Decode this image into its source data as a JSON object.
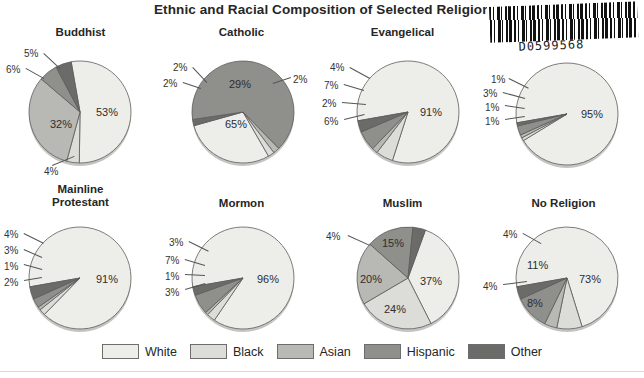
{
  "title": "Ethnic and Racial Composition of Selected Religions,",
  "barcode": {
    "number": "D0599568",
    "alt": "barcode-sticker"
  },
  "legend": {
    "items": [
      {
        "label": "White",
        "color": "#ededea"
      },
      {
        "label": "Black",
        "color": "#dcdcd8"
      },
      {
        "label": "Asian",
        "color": "#b8b8b4"
      },
      {
        "label": "Hispanic",
        "color": "#8f8f8c"
      },
      {
        "label": "Other",
        "color": "#6b6b69"
      }
    ]
  },
  "chart_data": {
    "type": "pie",
    "title": "Ethnic and Racial Composition of Selected Religions,",
    "categories": [
      "White",
      "Black",
      "Asian",
      "Hispanic",
      "Other"
    ],
    "colors": [
      "#ededea",
      "#dcdcd8",
      "#b8b8b4",
      "#8f8f8c",
      "#6b6b69"
    ],
    "unit": "%",
    "legend_position": "bottom",
    "charts": [
      {
        "name": "Buddhist",
        "title": "Buddhist",
        "values": [
          53,
          4,
          32,
          6,
          5
        ],
        "labels": [
          "53%",
          "4%",
          "32%",
          "6%",
          "5%"
        ]
      },
      {
        "name": "Catholic",
        "title": "Catholic",
        "values": [
          29,
          2,
          2,
          65,
          2
        ],
        "labels": [
          "29%",
          "2%",
          "2%",
          "65%",
          "2%"
        ]
      },
      {
        "name": "Evangelical",
        "title": "Evangelical",
        "values": [
          91,
          6,
          2,
          7,
          4
        ],
        "labels": [
          "91%",
          "6%",
          "2%",
          "7%",
          "4%"
        ]
      },
      {
        "name": "Jewish",
        "title": "",
        "values": [
          95,
          1,
          1,
          3,
          1
        ],
        "labels": [
          "95%",
          "1%",
          "1%",
          "3%",
          "1%"
        ]
      },
      {
        "name": "Mainline Protestant",
        "title": "Mainline\nProtestant",
        "values": [
          91,
          2,
          1,
          3,
          4
        ],
        "labels": [
          "91%",
          "2%",
          "1%",
          "3%",
          "4%"
        ]
      },
      {
        "name": "Mormon",
        "title": "Mormon",
        "values": [
          96,
          3,
          1,
          7,
          3
        ],
        "labels": [
          "96%",
          "3%",
          "1%",
          "7%",
          "3%"
        ]
      },
      {
        "name": "Muslim",
        "title": "Muslim",
        "values": [
          37,
          24,
          20,
          15,
          4
        ],
        "labels": [
          "37%",
          "24%",
          "20%",
          "15%",
          "4%"
        ]
      },
      {
        "name": "No Religion",
        "title": "No Religion",
        "values": [
          73,
          8,
          4,
          11,
          4
        ],
        "labels": [
          "73%",
          "8%",
          "4%",
          "11%",
          "4%"
        ]
      }
    ]
  },
  "layout": {
    "cells": [
      {
        "chart": 0,
        "x": 0,
        "y": 0,
        "cx": 80,
        "cy": 86,
        "r": 51,
        "title_top": 0
      },
      {
        "chart": 1,
        "x": 161,
        "y": 0,
        "cx": 82,
        "cy": 86,
        "r": 51,
        "title_top": 0
      },
      {
        "chart": 2,
        "x": 322,
        "y": 0,
        "cx": 86,
        "cy": 86,
        "r": 51,
        "title_top": 0
      },
      {
        "chart": 3,
        "x": 483,
        "y": 0,
        "cx": 84,
        "cy": 88,
        "r": 51,
        "title_top": 0
      },
      {
        "chart": 4,
        "x": 0,
        "y": 155,
        "cx": 80,
        "cy": 97,
        "r": 51,
        "title_top": 2
      },
      {
        "chart": 5,
        "x": 161,
        "y": 155,
        "cx": 82,
        "cy": 97,
        "r": 51,
        "title_top": 16
      },
      {
        "chart": 6,
        "x": 322,
        "y": 155,
        "cx": 86,
        "cy": 97,
        "r": 51,
        "title_top": 16
      },
      {
        "chart": 7,
        "x": 483,
        "y": 155,
        "cx": 84,
        "cy": 97,
        "r": 51,
        "title_top": 16
      }
    ]
  },
  "label_positions": [
    [
      {
        "i": 0,
        "x": 96,
        "y": 80,
        "inner": true
      },
      {
        "i": 1,
        "x": 44,
        "y": 140,
        "inner": false,
        "lx": 52,
        "ly": 139,
        "tx": 74,
        "ty": 130
      },
      {
        "i": 2,
        "x": 50,
        "y": 92,
        "inner": true
      },
      {
        "i": 3,
        "x": 6,
        "y": 38,
        "inner": false,
        "lx": 26,
        "ly": 42,
        "tx": 44,
        "ty": 52
      },
      {
        "i": 4,
        "x": 24,
        "y": 22,
        "inner": false,
        "lx": 44,
        "ly": 27,
        "tx": 60,
        "ty": 42
      }
    ],
    [
      {
        "i": 0,
        "x": 68,
        "y": 52,
        "inner": true
      },
      {
        "i": 3,
        "x": 64,
        "y": 92,
        "inner": true
      },
      {
        "i": 1,
        "x": 2,
        "y": 52,
        "inner": false,
        "lx": 22,
        "ly": 56,
        "tx": 40,
        "ty": 62
      },
      {
        "i": 2,
        "x": 12,
        "y": 36,
        "inner": false,
        "lx": 32,
        "ly": 41,
        "tx": 46,
        "ty": 56
      },
      {
        "i": 4,
        "x": 132,
        "y": 48,
        "inner": false,
        "lx": 130,
        "ly": 52,
        "tx": 112,
        "ty": 58
      }
    ],
    [
      {
        "i": 0,
        "x": 98,
        "y": 80,
        "inner": true
      },
      {
        "i": 4,
        "x": 8,
        "y": 36,
        "inner": false,
        "lx": 28,
        "ly": 41,
        "tx": 48,
        "ty": 52
      },
      {
        "i": 3,
        "x": 2,
        "y": 54,
        "inner": false,
        "lx": 22,
        "ly": 58,
        "tx": 42,
        "ty": 64
      },
      {
        "i": 2,
        "x": 0,
        "y": 72,
        "inner": false,
        "lx": 20,
        "ly": 76,
        "tx": 44,
        "ty": 78
      },
      {
        "i": 1,
        "x": 2,
        "y": 90,
        "inner": false,
        "lx": 22,
        "ly": 93,
        "tx": 42,
        "ty": 88
      }
    ],
    [
      {
        "i": 0,
        "x": 98,
        "y": 82,
        "inner": true
      },
      {
        "i": 4,
        "x": 8,
        "y": 48,
        "inner": false,
        "lx": 26,
        "ly": 52,
        "tx": 46,
        "ty": 62
      },
      {
        "i": 3,
        "x": 0,
        "y": 62,
        "inner": false,
        "lx": 20,
        "ly": 66,
        "tx": 42,
        "ty": 72
      },
      {
        "i": 2,
        "x": 2,
        "y": 76,
        "inner": false,
        "lx": 22,
        "ly": 79,
        "tx": 42,
        "ty": 82
      },
      {
        "i": 1,
        "x": 2,
        "y": 90,
        "inner": false,
        "lx": 22,
        "ly": 93,
        "tx": 42,
        "ty": 90
      }
    ],
    [
      {
        "i": 0,
        "x": 96,
        "y": 92,
        "inner": true
      },
      {
        "i": 4,
        "x": 4,
        "y": 48,
        "inner": false,
        "lx": 24,
        "ly": 52,
        "tx": 44,
        "ty": 62
      },
      {
        "i": 3,
        "x": 4,
        "y": 64,
        "inner": false,
        "lx": 24,
        "ly": 68,
        "tx": 42,
        "ty": 76
      },
      {
        "i": 2,
        "x": 4,
        "y": 80,
        "inner": false,
        "lx": 24,
        "ly": 83,
        "tx": 42,
        "ty": 88
      },
      {
        "i": 1,
        "x": 4,
        "y": 96,
        "inner": false,
        "lx": 24,
        "ly": 99,
        "tx": 42,
        "ty": 96
      }
    ],
    [
      {
        "i": 0,
        "x": 96,
        "y": 92,
        "inner": true
      },
      {
        "i": 1,
        "x": 8,
        "y": 56,
        "inner": false,
        "lx": 28,
        "ly": 60,
        "tx": 48,
        "ty": 70
      },
      {
        "i": 3,
        "x": 4,
        "y": 74,
        "inner": false,
        "lx": 24,
        "ly": 78,
        "tx": 44,
        "ty": 84
      },
      {
        "i": 2,
        "x": 4,
        "y": 90,
        "inner": false,
        "lx": 24,
        "ly": 93,
        "tx": 44,
        "ty": 94
      },
      {
        "i": 4,
        "x": 4,
        "y": 106,
        "inner": false,
        "lx": 24,
        "ly": 108,
        "tx": 44,
        "ty": 102
      }
    ],
    [
      {
        "i": 0,
        "x": 98,
        "y": 94,
        "inner": true
      },
      {
        "i": 3,
        "x": 60,
        "y": 56,
        "inner": true
      },
      {
        "i": 2,
        "x": 38,
        "y": 92,
        "inner": true
      },
      {
        "i": 1,
        "x": 62,
        "y": 122,
        "inner": true
      },
      {
        "i": 4,
        "x": 4,
        "y": 50,
        "inner": false,
        "lx": 26,
        "ly": 54,
        "tx": 48,
        "ty": 64
      }
    ],
    [
      {
        "i": 0,
        "x": 96,
        "y": 92,
        "inner": true
      },
      {
        "i": 3,
        "x": 44,
        "y": 78,
        "inner": true
      },
      {
        "i": 1,
        "x": 44,
        "y": 116,
        "inner": true
      },
      {
        "i": 4,
        "x": 20,
        "y": 48,
        "inner": false,
        "lx": 40,
        "ly": 52,
        "tx": 58,
        "ty": 62
      },
      {
        "i": 2,
        "x": 0,
        "y": 100,
        "inner": false,
        "lx": 20,
        "ly": 103,
        "tx": 44,
        "ty": 100
      }
    ]
  ]
}
